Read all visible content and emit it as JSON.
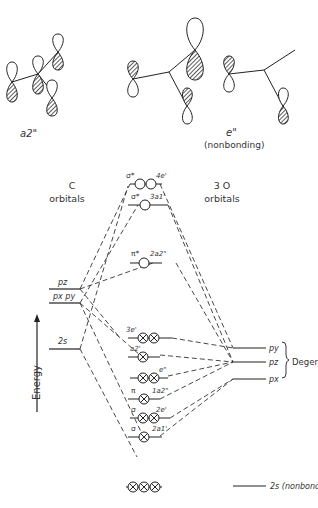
{
  "top_orbitals": {
    "left_label": "a2\"",
    "right_label": "e\"",
    "right_sublabel": "(nonbonding)"
  },
  "headers": {
    "left_title": "C",
    "left_sub": "orbitals",
    "right_title": "3 O",
    "right_sub": "orbitals"
  },
  "axis": {
    "label": "Energy"
  },
  "c_levels": [
    {
      "label": "pz"
    },
    {
      "label": "px py"
    },
    {
      "label": "2s"
    }
  ],
  "mo_levels": [
    {
      "star": "σ*",
      "sym": "4e'"
    },
    {
      "star": "σ*",
      "sym": "3a1'"
    },
    {
      "star": "π*",
      "sym": "2a2\""
    },
    {
      "star": "",
      "sym": "3e'"
    },
    {
      "star": "",
      "sym": "a2'"
    },
    {
      "star": "",
      "sym": "e\""
    },
    {
      "star": "π",
      "sym": "1a2\""
    },
    {
      "star": "σ",
      "sym": "2e'"
    },
    {
      "star": "σ",
      "sym": "2a1'"
    }
  ],
  "o_levels": [
    {
      "label": "py"
    },
    {
      "label": "pz"
    },
    {
      "label": "px"
    }
  ],
  "degenerate_label": "Degenerate",
  "nonbonding_label": "2s (nonbonding)"
}
